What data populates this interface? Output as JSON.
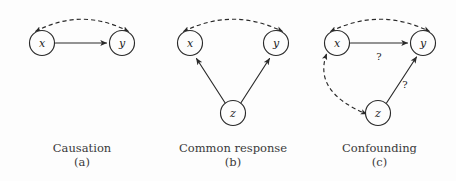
{
  "figure": {
    "background_color": "#fdfdfd",
    "ink_color": "#2a2a2a",
    "panels": [
      {
        "id": "causation",
        "caption_title": "Causation",
        "caption_letter": "(a)",
        "nodes": [
          {
            "id": "x",
            "label": "x",
            "cx": 42,
            "cy": 43,
            "r": 12.5
          },
          {
            "id": "y",
            "label": "y",
            "cx": 122,
            "cy": 43,
            "r": 12.5
          }
        ],
        "edges": [
          {
            "id": "x-y-assoc",
            "style": "dashed",
            "from": "x",
            "to": "y",
            "arrow": "both",
            "label": ""
          },
          {
            "id": "x-to-y-cause",
            "style": "solid",
            "from": "x",
            "to": "y",
            "arrow": "end",
            "label": ""
          }
        ]
      },
      {
        "id": "common-response",
        "caption_title": "Common response",
        "caption_letter": "(b)",
        "nodes": [
          {
            "id": "x",
            "label": "x",
            "cx": 190,
            "cy": 43,
            "r": 12.5
          },
          {
            "id": "y",
            "label": "y",
            "cx": 276,
            "cy": 43,
            "r": 12.5
          },
          {
            "id": "z",
            "label": "z",
            "cx": 233,
            "cy": 113,
            "r": 12.5
          }
        ],
        "edges": [
          {
            "id": "x-y-assoc",
            "style": "dashed",
            "from": "x",
            "to": "y",
            "arrow": "both",
            "label": ""
          },
          {
            "id": "z-to-x",
            "style": "solid",
            "from": "z",
            "to": "x",
            "arrow": "end",
            "label": ""
          },
          {
            "id": "z-to-y",
            "style": "solid",
            "from": "z",
            "to": "y",
            "arrow": "end",
            "label": ""
          }
        ]
      },
      {
        "id": "confounding",
        "caption_title": "Confounding",
        "caption_letter": "(c)",
        "nodes": [
          {
            "id": "x",
            "label": "x",
            "cx": 337,
            "cy": 43,
            "r": 12.5
          },
          {
            "id": "y",
            "label": "y",
            "cx": 423,
            "cy": 43,
            "r": 12.5
          },
          {
            "id": "z",
            "label": "z",
            "cx": 378,
            "cy": 113,
            "r": 12.5
          }
        ],
        "edges": [
          {
            "id": "x-y-assoc",
            "style": "dashed",
            "from": "x",
            "to": "y",
            "arrow": "both",
            "label": ""
          },
          {
            "id": "x-to-y-cause",
            "style": "solid",
            "from": "x",
            "to": "y",
            "arrow": "end",
            "label": "?"
          },
          {
            "id": "x-z-assoc",
            "style": "dashed",
            "from": "x",
            "to": "z",
            "arrow": "both",
            "label": ""
          },
          {
            "id": "z-to-y-cause",
            "style": "solid",
            "from": "z",
            "to": "y",
            "arrow": "end",
            "label": "?"
          }
        ]
      }
    ],
    "labels": {
      "question_mark_a": "?",
      "question_mark_b": "?"
    }
  }
}
